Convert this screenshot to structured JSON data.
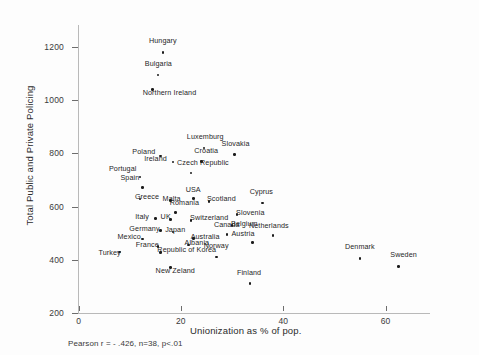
{
  "chart_data": {
    "type": "scatter",
    "title": "",
    "xlabel": "Unionization as % of pop.",
    "ylabel": "Total Public and Private Policing",
    "xlim": [
      -4,
      72
    ],
    "ylim": [
      200,
      1260
    ],
    "xticks": [
      0,
      20,
      40,
      60
    ],
    "yticks": [
      200,
      400,
      600,
      800,
      1000,
      1200
    ],
    "grid": false,
    "legend": null,
    "annotation": "Pearson r = - .426, n=38, p<.01",
    "points": [
      {
        "label": "Hungary",
        "x": 16.5,
        "y": 1180,
        "lx": -14,
        "ly": -11
      },
      {
        "label": "Bulgaria",
        "x": 15.5,
        "y": 1095,
        "lx": -13,
        "ly": -11
      },
      {
        "label": "Northern Ireland",
        "x": 14.5,
        "y": 1040,
        "lx": -10,
        "ly": 3
      },
      {
        "label": "Luxemburg",
        "x": 24.5,
        "y": 820,
        "lx": -17,
        "ly": -11
      },
      {
        "label": "Slovakia",
        "x": 30.5,
        "y": 795,
        "lx": -13,
        "ly": -11
      },
      {
        "label": "Poland",
        "x": 16.0,
        "y": 790,
        "lx": -28,
        "ly": -4
      },
      {
        "label": "Croatia",
        "x": 24.0,
        "y": 770,
        "lx": -7,
        "ly": -10
      },
      {
        "label": "Ireland",
        "x": 18.5,
        "y": 768,
        "lx": -29,
        "ly": -3
      },
      {
        "label": "Czech Republic",
        "x": 22.0,
        "y": 727,
        "lx": -14,
        "ly": -10
      },
      {
        "label": "Portugal",
        "x": 12.0,
        "y": 712,
        "lx": -31,
        "ly": -8
      },
      {
        "label": "Spain",
        "x": 12.5,
        "y": 672,
        "lx": -22,
        "ly": -9
      },
      {
        "label": "Greece",
        "x": 12.0,
        "y": 628,
        "lx": -5,
        "ly": -2
      },
      {
        "label": "Malta",
        "x": 18.0,
        "y": 622,
        "lx": -8,
        "ly": -2
      },
      {
        "label": "USA",
        "x": 22.5,
        "y": 630,
        "lx": -8,
        "ly": -9
      },
      {
        "label": "Scotland",
        "x": 25.5,
        "y": 620,
        "lx": -2,
        "ly": -2
      },
      {
        "label": "Cyprus",
        "x": 36.0,
        "y": 613,
        "lx": -13,
        "ly": -11
      },
      {
        "label": "Romania",
        "x": 19.0,
        "y": 578,
        "lx": -6,
        "ly": -9
      },
      {
        "label": "Slovenia",
        "x": 31.0,
        "y": 570,
        "lx": -1,
        "ly": -2
      },
      {
        "label": "Italy",
        "x": 15.0,
        "y": 555,
        "lx": -20,
        "ly": -2
      },
      {
        "label": "UK",
        "x": 18.0,
        "y": 552,
        "lx": -10,
        "ly": -2
      },
      {
        "label": "Switzerland",
        "x": 22.0,
        "y": 548,
        "lx": -1,
        "ly": -2
      },
      {
        "label": "Belgium",
        "x": 30.0,
        "y": 528,
        "lx": -1,
        "ly": -2
      },
      {
        "label": "Germany",
        "x": 16.0,
        "y": 510,
        "lx": -31,
        "ly": -2
      },
      {
        "label": "Japan",
        "x": 18.5,
        "y": 505,
        "lx": -8,
        "ly": -2
      },
      {
        "label": "Canada",
        "x": 29.0,
        "y": 496,
        "lx": -13,
        "ly": -9
      },
      {
        "label": "Netherlands",
        "x": 38.0,
        "y": 492,
        "lx": -24,
        "ly": -9
      },
      {
        "label": "Mexico",
        "x": 12.5,
        "y": 478,
        "lx": -25,
        "ly": -2
      },
      {
        "label": "Australia",
        "x": 22.5,
        "y": 480,
        "lx": -3,
        "ly": -2
      },
      {
        "label": "Austria",
        "x": 34.0,
        "y": 466,
        "lx": -21,
        "ly": -8
      },
      {
        "label": "France",
        "x": 15.5,
        "y": 450,
        "lx": -22,
        "ly": -2
      },
      {
        "label": "Albania",
        "x": 21.5,
        "y": 455,
        "lx": -4,
        "ly": -2
      },
      {
        "label": "Turkey",
        "x": 8.0,
        "y": 430,
        "lx": -21,
        "ly": 1
      },
      {
        "label": "Republic of Korea",
        "x": 16.0,
        "y": 428,
        "lx": -3,
        "ly": -2
      },
      {
        "label": "Norway",
        "x": 27.0,
        "y": 410,
        "lx": -13,
        "ly": -11
      },
      {
        "label": "Denmark",
        "x": 55.0,
        "y": 405,
        "lx": -15,
        "ly": -11
      },
      {
        "label": "Sweden",
        "x": 62.5,
        "y": 375,
        "lx": -8,
        "ly": -11
      },
      {
        "label": "New Zeland",
        "x": 18.0,
        "y": 370,
        "lx": -15,
        "ly": 3
      },
      {
        "label": "Finland",
        "x": 33.5,
        "y": 310,
        "lx": -13,
        "ly": -11
      }
    ]
  }
}
